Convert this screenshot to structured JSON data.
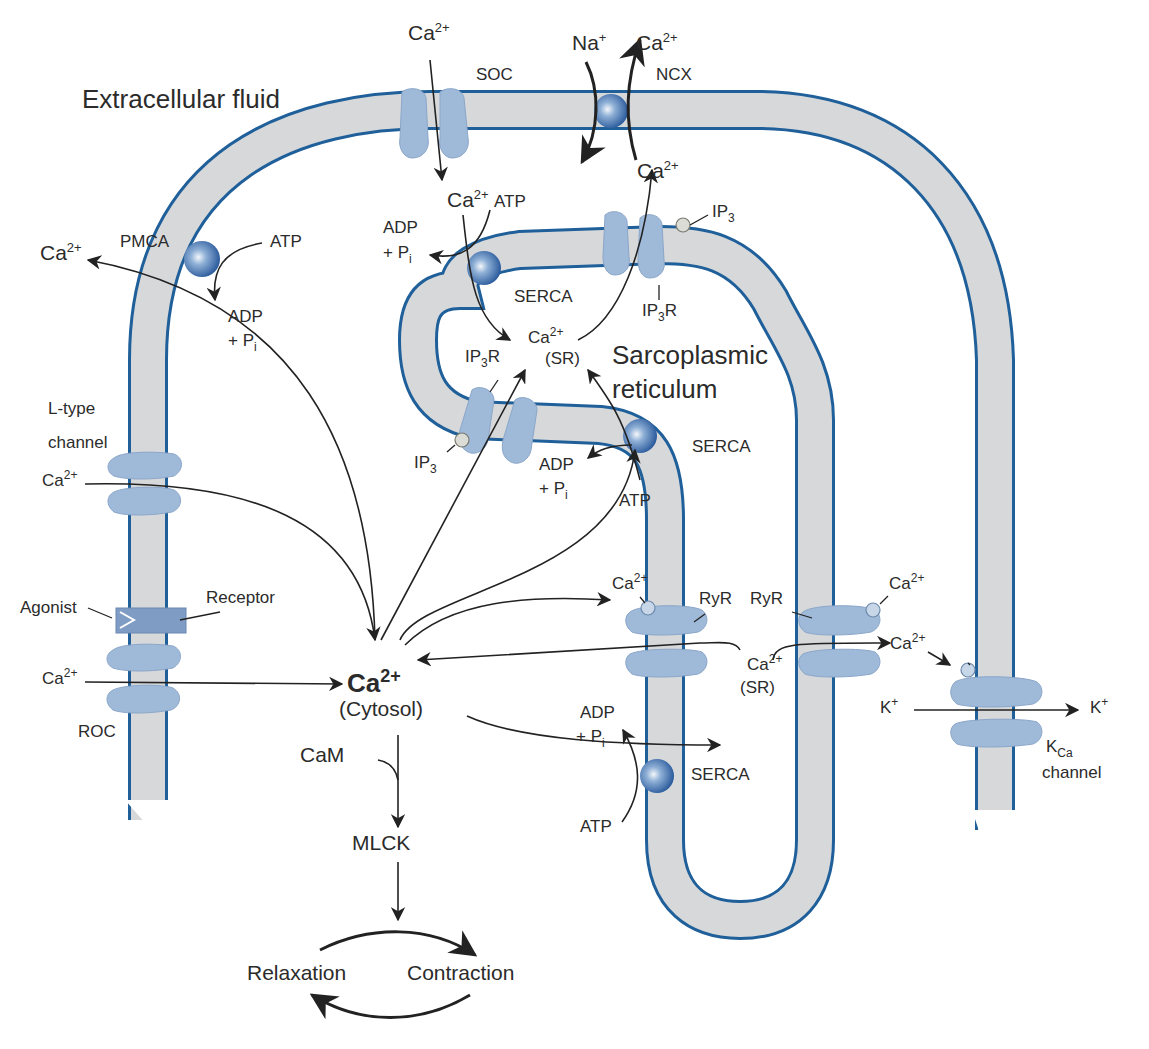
{
  "diagram": {
    "title_region": "Extracellular fluid",
    "compartments": {
      "extracellular": "Extracellular fluid",
      "sr": [
        "Sarcoplasmic",
        "reticulum"
      ]
    },
    "plasma_membrane": {
      "pmca": {
        "label": "PMCA",
        "ion_out": "Ca",
        "ion_out_sup": "2+",
        "atp": "ATP",
        "adp": "ADP",
        "pi": "+ P",
        "pi_sub": "i"
      },
      "soc": {
        "label": "SOC",
        "ion_in": "Ca",
        "ion_in_sup": "2+"
      },
      "ncx": {
        "label": "NCX",
        "na": "Na",
        "na_sup": "+",
        "ca_out": "Ca",
        "ca_out_sup": "2+",
        "ca_in": "Ca",
        "ca_in_sup": "2+"
      },
      "l_type": {
        "label_line1": "L-type",
        "label_line2": "channel",
        "ion": "Ca",
        "ion_sup": "2+"
      },
      "receptor": {
        "agonist": "Agonist",
        "receptor": "Receptor"
      },
      "roc": {
        "label": "ROC",
        "ion": "Ca",
        "ion_sup": "2+"
      },
      "kca": {
        "label_main": "K",
        "label_sub": "Ca",
        "label_line2": "channel",
        "k_in": "K",
        "k_in_sup": "+",
        "k_out": "K",
        "k_out_sup": "+",
        "ca": "Ca",
        "ca_sup": "2+"
      }
    },
    "sr_membrane": {
      "serca_top": {
        "label": "SERCA",
        "ca": "Ca",
        "ca_sup": "2+",
        "atp": "ATP",
        "adp": "ADP",
        "pi": "+ P",
        "pi_sub": "i"
      },
      "ip3r_top": {
        "label": "IP",
        "label_sub": "3",
        "label_tail": "R",
        "ip3": "IP",
        "ip3_sub": "3"
      },
      "ca_sr_center": {
        "ion": "Ca",
        "ion_sup": "2+",
        "loc": "(SR)"
      },
      "ip3r_left": {
        "label": "IP",
        "label_sub": "3",
        "label_tail": "R",
        "ip3": "IP",
        "ip3_sub": "3"
      },
      "serca_mid": {
        "label": "SERCA",
        "atp": "ATP",
        "adp": "ADP",
        "pi": "+ P",
        "pi_sub": "i"
      },
      "ryr_left": {
        "label": "RyR",
        "ca": "Ca",
        "ca_sup": "2+"
      },
      "ryr_right": {
        "label": "RyR",
        "ca": "Ca",
        "ca_sup": "2+",
        "ca_out": "Ca",
        "ca_out_sup": "2+"
      },
      "ca_sr_lower": {
        "ion": "Ca",
        "ion_sup": "2+",
        "loc": "(SR)"
      },
      "serca_bottom": {
        "label": "SERCA",
        "atp": "ATP",
        "adp": "ADP",
        "pi": "+ P",
        "pi_sub": "i"
      }
    },
    "cytosol": {
      "ion": "Ca",
      "ion_sup": "2+",
      "loc": "(Cytosol)"
    },
    "pathway": {
      "cam": "CaM",
      "mlck": "MLCK",
      "relaxation": "Relaxation",
      "contraction": "Contraction"
    },
    "colors": {
      "membrane_edge": "#1f5f9a",
      "membrane_fill": "#d6d8da",
      "channel": "#9fb9d9",
      "pump": "#2f64a8",
      "text": "#2b2b2b"
    }
  }
}
